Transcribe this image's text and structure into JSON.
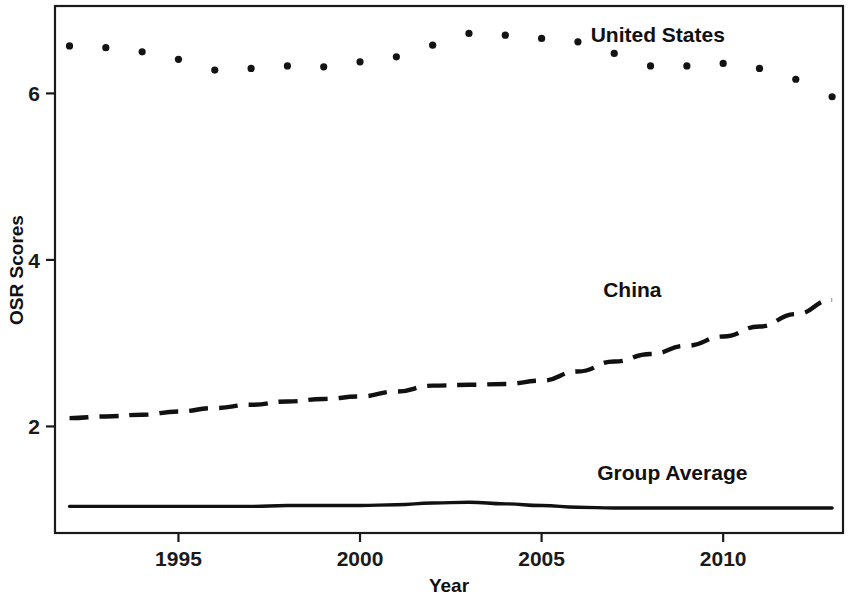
{
  "chart_data": {
    "type": "line",
    "title": "",
    "subtitle": "",
    "xlabel": "Year",
    "ylabel": "OSR Scores",
    "xlim": [
      1991.6,
      2013.3
    ],
    "ylim": [
      0.72,
      7.05
    ],
    "grid": false,
    "legend_position": "inline-right-annotations",
    "xticks": [
      1995,
      2000,
      2005,
      2010
    ],
    "xtick_labels": [
      "1995",
      "2000",
      "2005",
      "2010"
    ],
    "yticks": [
      2,
      4,
      6
    ],
    "ytick_labels": [
      "2",
      "4",
      "6"
    ],
    "x": [
      1992,
      1993,
      1994,
      1995,
      1996,
      1997,
      1998,
      1999,
      2000,
      2001,
      2002,
      2003,
      2004,
      2005,
      2006,
      2007,
      2008,
      2009,
      2010,
      2011,
      2012,
      2013
    ],
    "series": [
      {
        "name": "United States",
        "style": "dotted",
        "color": "#131313",
        "label_x": 2008.2,
        "label_y": 6.62,
        "values": [
          6.57,
          6.55,
          6.5,
          6.41,
          6.28,
          6.3,
          6.33,
          6.32,
          6.38,
          6.44,
          6.58,
          6.72,
          6.7,
          6.66,
          6.62,
          6.48,
          6.33,
          6.33,
          6.36,
          6.3,
          6.17,
          5.96
        ]
      },
      {
        "name": "China",
        "style": "dashed",
        "color": "#111111",
        "label_x": 2007.5,
        "label_y": 3.55,
        "values": [
          2.1,
          2.12,
          2.14,
          2.18,
          2.22,
          2.26,
          2.3,
          2.33,
          2.36,
          2.42,
          2.49,
          2.5,
          2.51,
          2.55,
          2.66,
          2.78,
          2.87,
          2.97,
          3.08,
          3.2,
          3.35,
          3.52
        ]
      },
      {
        "name": "Group Average",
        "style": "solid",
        "color": "#111111",
        "label_x": 2008.6,
        "label_y": 1.36,
        "values": [
          1.04,
          1.04,
          1.04,
          1.04,
          1.04,
          1.04,
          1.05,
          1.05,
          1.05,
          1.06,
          1.08,
          1.09,
          1.07,
          1.05,
          1.03,
          1.02,
          1.02,
          1.02,
          1.02,
          1.02,
          1.02,
          1.02
        ]
      }
    ]
  },
  "axes": {
    "y_title": "OSR Scores",
    "x_title": "Year"
  }
}
